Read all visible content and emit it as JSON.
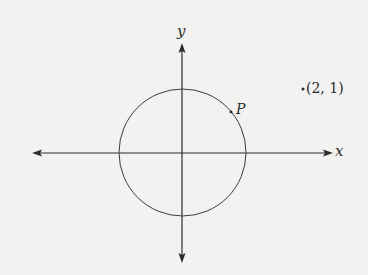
{
  "diagram": {
    "type": "coordinate-plane-with-circle",
    "axes": {
      "x_label": "x",
      "y_label": "y",
      "color": "#2a2a2a"
    },
    "circle": {
      "center": "origin",
      "color": "#3a3a3a"
    },
    "points": [
      {
        "name": "P",
        "label": "P",
        "on_circle": true
      },
      {
        "name": "external-point",
        "label": "(2, 1)",
        "marker": "."
      }
    ],
    "background": "#f2f2f0"
  }
}
